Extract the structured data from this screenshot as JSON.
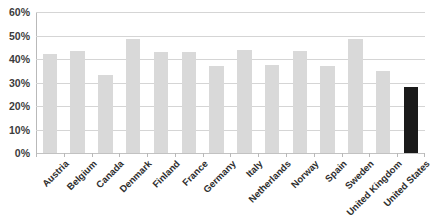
{
  "chart_data": {
    "type": "bar",
    "title": "",
    "title_clipped_text": "",
    "xlabel": "",
    "ylabel": "",
    "ylim": [
      0,
      60
    ],
    "ytick_labels": [
      "60%",
      "50%",
      "40%",
      "30%",
      "20%",
      "10%",
      "0%"
    ],
    "ytick_values": [
      60,
      50,
      40,
      30,
      20,
      10,
      0
    ],
    "grid": true,
    "legend": "none",
    "value_suffix": "%",
    "categories": [
      "Austria",
      "Belgium",
      "Canada",
      "Denmark",
      "Finland",
      "France",
      "Germany",
      "Italy",
      "Netherlands",
      "Norway",
      "Spain",
      "Sweden",
      "United Kingdom",
      "United States"
    ],
    "values": [
      42,
      43.5,
      33,
      48.5,
      43,
      43,
      37,
      44,
      37.5,
      43.5,
      37,
      48.5,
      35,
      28
    ],
    "highlight_category": "United States",
    "colors": {
      "bar": "#d9d9d9",
      "bar_highlight": "#1a1a1a",
      "gridline": "#d5d5d5",
      "axis": "#b9b9b9",
      "tick_label": "#3c3c3c",
      "category_label": "#2e2e2e",
      "background": "#ffffff"
    }
  }
}
